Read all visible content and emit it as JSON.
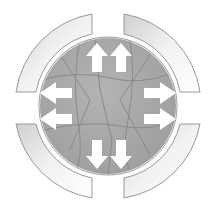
{
  "diagram": {
    "center": [
      108,
      106
    ],
    "circle_radius": 68,
    "circle_color": "#a8a8a8",
    "crack_color": "#8c8c8c",
    "arrow_color": "#ffffff",
    "arc_fill_light": "#f4f4f4",
    "arc_fill_dark": "#cfcfcf",
    "arc_stroke": "#9a9a9a",
    "arrows": [
      {
        "direction": "up",
        "count": 2
      },
      {
        "direction": "right",
        "count": 2
      },
      {
        "direction": "down",
        "count": 2
      },
      {
        "direction": "left",
        "count": 2
      }
    ],
    "arcs": [
      "top-left",
      "top-right",
      "bottom-right",
      "bottom-left"
    ]
  }
}
